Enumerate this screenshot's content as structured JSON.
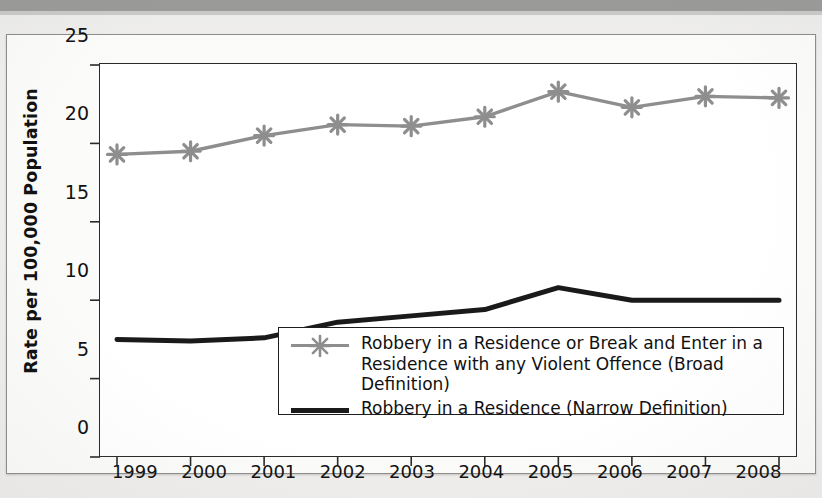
{
  "chart_data": {
    "type": "line",
    "title": "",
    "subtitle": "",
    "xlabel": "",
    "ylabel": "Rate per 100,000 Population",
    "categories": [
      "1999",
      "2000",
      "2001",
      "2002",
      "2003",
      "2004",
      "2005",
      "2006",
      "2007",
      "2008"
    ],
    "x": [
      1999,
      2000,
      2001,
      2002,
      2003,
      2004,
      2005,
      2006,
      2007,
      2008
    ],
    "ylim": [
      0,
      25
    ],
    "yticks": [
      0,
      5,
      10,
      15,
      20,
      25
    ],
    "ytick_labels": [
      "0",
      "5",
      "10",
      "15",
      "20",
      "25"
    ],
    "grid": false,
    "legend_position": "bottom-center-inside",
    "series": [
      {
        "name": "Robbery in a Residence or Break and Enter in a Residence with any Violent Offence (Broad Definition)",
        "color": "#8e8e8e",
        "marker": "asterisk",
        "values": [
          19.3,
          19.5,
          20.5,
          21.2,
          21.1,
          21.7,
          23.3,
          22.3,
          23.0,
          22.9
        ]
      },
      {
        "name": "Robbery in a Residence (Narrow Definition)",
        "color": "#1a1a1a",
        "marker": "none",
        "values": [
          7.5,
          7.4,
          7.6,
          8.6,
          9.0,
          9.4,
          10.8,
          10.0,
          10.0,
          10.0
        ]
      }
    ]
  },
  "legend": {
    "items": [
      {
        "label": "Robbery in a Residence or Break and Enter in a\nResidence with any Violent Offence (Broad Definition)",
        "swatch": "gray-line-with-asterisk"
      },
      {
        "label": "Robbery in a Residence (Narrow Definition)",
        "swatch": "black-thick-line"
      }
    ]
  },
  "colors": {
    "broad_series": "#8e8e8e",
    "narrow_series": "#1a1a1a",
    "axis": "#2a2a2a",
    "page_background": "#f0efee",
    "plot_background": "#ffffff"
  }
}
